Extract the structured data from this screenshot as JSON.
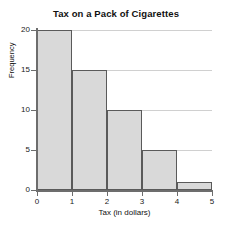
{
  "chart_data": {
    "type": "bar",
    "title": "Tax on a Pack of Cigarettes",
    "xlabel": "Tax (in dollars)",
    "ylabel": "Frequency",
    "histogram": true,
    "bin_edges": [
      0,
      1,
      2,
      3,
      4,
      5
    ],
    "categories": [
      "0-1",
      "1-2",
      "2-3",
      "3-4",
      "4-5"
    ],
    "values": [
      20,
      15,
      10,
      5,
      1
    ],
    "xlim": [
      0,
      5
    ],
    "ylim": [
      0,
      20
    ],
    "x_ticks": [
      "0",
      "1",
      "2",
      "3",
      "4",
      "5"
    ],
    "y_ticks": [
      "0",
      "5",
      "10",
      "15",
      "20"
    ],
    "grid": "horizontal",
    "legend": "none",
    "colors": {
      "bar_fill": "#d9d9d9",
      "bar_edge": "#5a5a5a",
      "gridline": "#d0d0d0",
      "axis": "#6d6d6d",
      "background": "#ffffff",
      "text": "#1a1a1a"
    }
  }
}
